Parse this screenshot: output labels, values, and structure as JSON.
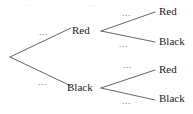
{
  "diagram": {
    "type": "probability-tree",
    "title": "",
    "root": {
      "label": "",
      "x": 10,
      "y": 57
    },
    "level1_nodes": [
      {
        "label": "Red",
        "x": 77,
        "y": 31
      },
      {
        "label": "Black",
        "x": 77,
        "y": 88
      }
    ],
    "level2_nodes": [
      {
        "label": "Red",
        "x": 162,
        "y": 14,
        "parent": "Red"
      },
      {
        "label": "Black",
        "x": 162,
        "y": 43,
        "parent": "Red"
      },
      {
        "label": "Red",
        "x": 162,
        "y": 72,
        "parent": "Black"
      },
      {
        "label": "Black",
        "x": 162,
        "y": 101,
        "parent": "Black"
      }
    ],
    "edge_labels": [
      {
        "text": "...",
        "x": 42,
        "y": 32,
        "edge": "root-to-red"
      },
      {
        "text": "...",
        "x": 42,
        "y": 82,
        "edge": "root-to-black"
      },
      {
        "text": "...",
        "x": 125,
        "y": 13,
        "edge": "red-to-red"
      },
      {
        "text": "...",
        "x": 122,
        "y": 43,
        "edge": "red-to-black"
      },
      {
        "text": "...",
        "x": 125,
        "y": 64,
        "edge": "black-to-red"
      },
      {
        "text": "...",
        "x": 125,
        "y": 100,
        "edge": "black-to-black"
      }
    ],
    "top_artifacts": [
      {
        "text": "...",
        "x": 22,
        "y": 0
      },
      {
        "text": "...",
        "x": 88,
        "y": 0
      },
      {
        "text": "...",
        "x": 160,
        "y": 0
      }
    ],
    "colors": {
      "line": "#55555a",
      "node_text": "#1c1c1c",
      "edge_text": "#4a4a4a",
      "background": "#ffffff"
    }
  }
}
